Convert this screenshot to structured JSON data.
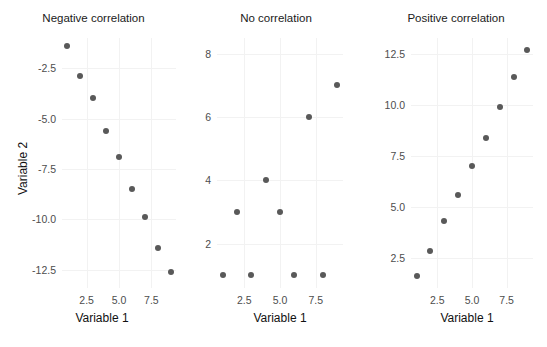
{
  "figure": {
    "width": 547,
    "height": 347,
    "background": "#ffffff",
    "point_color": "#595959",
    "grid_color": "#f2f2f2",
    "tick_label_color": "#4d4d4d",
    "axis_title_color": "#111111"
  },
  "axis_titles": {
    "y_left": "Variable 2",
    "x_left": "Variable 1",
    "x_middle": "Variable 1",
    "x_right": "Variable 1"
  },
  "chart_data": [
    {
      "type": "scatter",
      "title": "Negative correlation",
      "xlabel": "Variable 1",
      "ylabel": "Variable 2",
      "xlim": [
        0.6,
        9.4
      ],
      "ylim": [
        -13.4,
        -1.0
      ],
      "xticks": [
        2.5,
        5.0,
        7.5
      ],
      "xticklabels": [
        "2.5",
        "5.0",
        "7.5"
      ],
      "yticks": [
        -2.5,
        -5.0,
        -7.5,
        -10.0,
        -12.5
      ],
      "yticklabels": [
        "-2.5",
        "-5.0",
        "-7.5",
        "-10.0",
        "-12.5"
      ],
      "grid": true,
      "legend": "none",
      "x": [
        1,
        2,
        3,
        4,
        5,
        6,
        7,
        8,
        9
      ],
      "y": [
        -1.4,
        -2.9,
        -4.0,
        -5.6,
        -6.9,
        -8.5,
        -9.9,
        -11.4,
        -12.6
      ]
    },
    {
      "type": "scatter",
      "title": "No correlation",
      "xlabel": "Variable 1",
      "ylabel": "",
      "xlim": [
        0.6,
        9.4
      ],
      "ylim": [
        0.6,
        8.5
      ],
      "xticks": [
        2.5,
        5.0,
        7.5
      ],
      "xticklabels": [
        "2.5",
        "5.0",
        "7.5"
      ],
      "yticks": [
        2,
        4,
        6,
        8
      ],
      "yticklabels": [
        "2",
        "4",
        "6",
        "8"
      ],
      "grid": true,
      "legend": "none",
      "x": [
        1,
        2,
        3,
        4,
        5,
        6,
        7,
        8,
        9
      ],
      "y": [
        1.0,
        3.0,
        1.0,
        4.0,
        3.0,
        1.0,
        6.0,
        1.0,
        7.0
      ]
    },
    {
      "type": "scatter",
      "title": "Positive correlation",
      "xlabel": "Variable 1",
      "ylabel": "",
      "xlim": [
        0.6,
        9.4
      ],
      "ylim": [
        1.0,
        13.3
      ],
      "xticks": [
        2.5,
        5.0,
        7.5
      ],
      "xticklabels": [
        "2.5",
        "5.0",
        "7.5"
      ],
      "yticks": [
        2.5,
        5.0,
        7.5,
        10.0,
        12.5
      ],
      "yticklabels": [
        "2.5",
        "5.0",
        "7.5",
        "10.0",
        "12.5"
      ],
      "grid": true,
      "legend": "none",
      "x": [
        1,
        2,
        3,
        4,
        5,
        6,
        7,
        8,
        9
      ],
      "y": [
        1.6,
        2.8,
        4.3,
        5.6,
        7.0,
        8.4,
        9.9,
        11.4,
        12.7
      ]
    }
  ]
}
